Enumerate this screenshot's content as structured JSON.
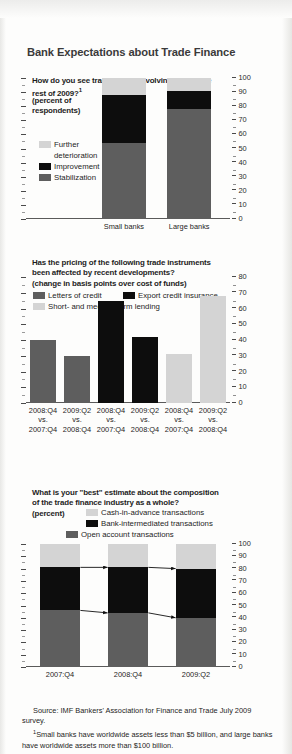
{
  "figure": {
    "title": "Bank Expectations about Trade Finance",
    "source_label": "Source: IMF Bankers' Association for Finance and Trade July 2009 survey.",
    "footnote_marker": "1",
    "footnote": "Small banks have worldwide assets less than $5 billion, and large banks have worldwide assets more than $100 billion.",
    "colors": {
      "light_gray": "#d4d4d4",
      "black": "#0d0d0d",
      "dark_gray": "#5e5e5e",
      "axis": "#4a4a4a",
      "text": "#1d1d1d",
      "title": "#3a3a3a",
      "background": "#fdfdfc"
    }
  },
  "chart_data": [
    {
      "id": "panel1",
      "type": "bar",
      "stacked": true,
      "title": "How do you see trade finance evolving during the rest of 2009?",
      "title_superscript": "1",
      "subtitle_line1": "(percent of",
      "subtitle_line2": "respondents)",
      "ylabel": "",
      "xlabel": "",
      "ylim": [
        0,
        100
      ],
      "yticks": [
        0,
        10,
        20,
        30,
        40,
        50,
        60,
        70,
        80,
        90,
        100
      ],
      "ytick_labels": [
        "0",
        "10",
        "20",
        "30",
        "40",
        "50",
        "60",
        "70",
        "80",
        "90",
        "100"
      ],
      "grid": false,
      "legend_position": "left-inside",
      "categories": [
        "Small banks",
        "Large banks"
      ],
      "series": [
        {
          "name": "Stabilization",
          "color": "#5e5e5e",
          "values": [
            54,
            78
          ]
        },
        {
          "name": "Improvement",
          "color": "#0d0d0d",
          "values": [
            34,
            13
          ]
        },
        {
          "name": "Further deterioration",
          "color": "#d4d4d4",
          "values": [
            12,
            9
          ]
        }
      ],
      "legend_entries": [
        {
          "label_line1": "Further",
          "label_line2": "deterioration",
          "color": "#d4d4d4"
        },
        {
          "label_line1": "Improvement",
          "label_line2": "",
          "color": "#0d0d0d"
        },
        {
          "label_line1": "Stabilization",
          "label_line2": "",
          "color": "#5e5e5e"
        }
      ]
    },
    {
      "id": "panel2",
      "type": "bar",
      "stacked": false,
      "title_line1": "Has the pricing of the following trade instruments",
      "title_line2": "been affected by recent developments?",
      "subtitle": "(change in basis points over cost of funds)",
      "ylim": [
        0,
        80
      ],
      "yticks": [
        0,
        10,
        20,
        30,
        40,
        50,
        60,
        70,
        80
      ],
      "ytick_labels": [
        "0",
        "10",
        "20",
        "30",
        "40",
        "50",
        "60",
        "70",
        "80"
      ],
      "grid": false,
      "legend_position": "top-inside",
      "legend_entries": [
        {
          "label": "Letters of credit",
          "color": "#5e5e5e"
        },
        {
          "label": "Export credit insurance",
          "color": "#0d0d0d"
        },
        {
          "label": "Short- and medium-term lending",
          "color": "#d4d4d4"
        }
      ],
      "categories": [
        {
          "l1": "2008:Q4",
          "l2": "vs.",
          "l3": "2007:Q4"
        },
        {
          "l1": "2009:Q2",
          "l2": "vs.",
          "l3": "2008:Q4"
        },
        {
          "l1": "2008:Q4",
          "l2": "vs.",
          "l3": "2007:Q4"
        },
        {
          "l1": "2009:Q2",
          "l2": "vs.",
          "l3": "2008:Q4"
        },
        {
          "l1": "2008:Q4",
          "l2": "vs.",
          "l3": "2007:Q4"
        },
        {
          "l1": "2009:Q2",
          "l2": "vs.",
          "l3": "2008:Q4"
        }
      ],
      "values": [
        40,
        30,
        65,
        42,
        31,
        68
      ],
      "bar_colors": [
        "#5e5e5e",
        "#5e5e5e",
        "#0d0d0d",
        "#0d0d0d",
        "#d4d4d4",
        "#d4d4d4"
      ]
    },
    {
      "id": "panel3",
      "type": "bar",
      "stacked": true,
      "title_line1": "What is your \"best\" estimate about the composition",
      "title_line2": "of the trade finance industry as a whole?",
      "subtitle": "(percent)",
      "ylim": [
        0,
        100
      ],
      "yticks": [
        0,
        10,
        20,
        30,
        40,
        50,
        60,
        70,
        80,
        90,
        100
      ],
      "ytick_labels": [
        "0",
        "10",
        "20",
        "30",
        "40",
        "50",
        "60",
        "70",
        "80",
        "90",
        "100"
      ],
      "grid": false,
      "legend_position": "top-inside",
      "categories": [
        "2007:Q4",
        "2008:Q4",
        "2009:Q2"
      ],
      "series": [
        {
          "name": "Open account transactions",
          "color": "#5e5e5e",
          "values": [
            46,
            44,
            40
          ]
        },
        {
          "name": "Bank-intermediated transactions",
          "color": "#0d0d0d",
          "values": [
            35,
            37,
            40
          ]
        },
        {
          "name": "Cash-in-advance transactions",
          "color": "#d4d4d4",
          "values": [
            19,
            19,
            20
          ]
        }
      ],
      "legend_entries": [
        {
          "label": "Cash-in-advance transactions",
          "color": "#d4d4d4"
        },
        {
          "label": "Bank-intermediated transactions",
          "color": "#0d0d0d"
        },
        {
          "label": "Open account transactions",
          "color": "#5e5e5e"
        }
      ],
      "annotations": [
        {
          "name": "arrow-top-1-2",
          "from_value": 81,
          "to_value": 81
        },
        {
          "name": "arrow-top-2-3",
          "from_value": 81,
          "to_value": 80
        },
        {
          "name": "arrow-bottom-1-2",
          "from_value": 46,
          "to_value": 44
        },
        {
          "name": "arrow-bottom-2-3",
          "from_value": 44,
          "to_value": 40
        }
      ]
    }
  ]
}
